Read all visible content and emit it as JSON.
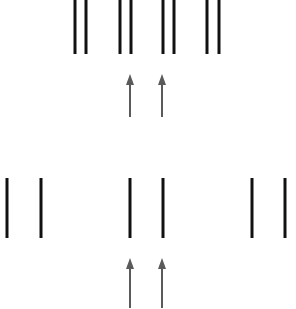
{
  "diagram": {
    "canvas": {
      "width": 296,
      "height": 309,
      "background": "#ffffff"
    },
    "colors": {
      "line": "#111111",
      "arrow": "#5a5a5a"
    },
    "line_width": 3,
    "arrow_width": 2,
    "top_row": {
      "y1": 0,
      "y2": 54,
      "pairs": [
        {
          "x1": 75,
          "x2": 86
        },
        {
          "x1": 120,
          "x2": 131
        },
        {
          "x1": 163,
          "x2": 174
        },
        {
          "x1": 207,
          "x2": 219
        }
      ],
      "arrows": [
        {
          "x": 130,
          "y_tip": 74,
          "y_tail": 117
        },
        {
          "x": 162,
          "y_tip": 74,
          "y_tail": 117
        }
      ]
    },
    "bottom_row": {
      "y1": 178,
      "y2": 238,
      "pairs": [
        {
          "x1": 7,
          "x2": 41
        },
        {
          "x1": 130,
          "x2": 163
        },
        {
          "x1": 252,
          "x2": 285
        }
      ],
      "arrows": [
        {
          "x": 130,
          "y_tip": 258,
          "y_tail": 308
        },
        {
          "x": 162,
          "y_tip": 258,
          "y_tail": 308
        }
      ]
    }
  }
}
